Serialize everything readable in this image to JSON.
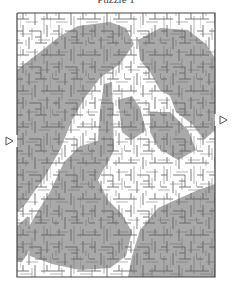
{
  "title": "Puzzle 1",
  "maze": {
    "frame": {
      "x": 17,
      "y": 13,
      "width": 198,
      "height": 264
    },
    "cell_size": 6,
    "entrance_arrow": {
      "side": "left",
      "x": 8,
      "y": 141,
      "icon": "triangle-right-outline"
    },
    "exit_arrow": {
      "side": "right",
      "x": 222,
      "y": 120,
      "icon": "triangle-right-outline"
    },
    "colors": {
      "background": "#ffffff",
      "shade": "#a9a9a9",
      "wall": "#5a5a5a",
      "border": "#444444"
    }
  }
}
